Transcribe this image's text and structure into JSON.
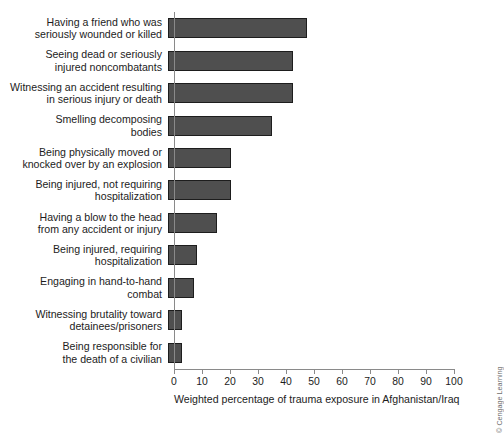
{
  "chart_data": {
    "type": "bar",
    "orientation": "horizontal",
    "title": "",
    "xlabel": "Weighted percentage of trauma exposure in Afghanistan/Iraq",
    "ylabel": "",
    "xlim": [
      0,
      100
    ],
    "xticks": [
      0,
      10,
      20,
      30,
      40,
      50,
      60,
      70,
      80,
      90,
      100
    ],
    "grid": false,
    "legend": null,
    "bar_color": "#4f4f4f",
    "bar_edge_color": "#1d1d1d",
    "categories": [
      "Having a friend who was\nseriously wounded or killed",
      "Seeing dead or seriously\ninjured noncombatants",
      "Witnessing an accident resulting\nin serious injury or death",
      "Smelling decomposing\nbodies",
      "Being physically moved or\nknocked over by an explosion",
      "Being injured, not requiring\nhospitalization",
      "Having a blow to the head\nfrom any accident or injury",
      "Being injured, requiring\nhospitalization",
      "Engaging in hand-to-hand\ncombat",
      "Witnessing brutality toward\ndetainees/prisoners",
      "Being responsible for\nthe death of a civilian"
    ],
    "values": [
      49.5,
      44.5,
      44.5,
      37,
      22.5,
      22.5,
      17.5,
      10.5,
      9.3,
      5,
      5
    ]
  },
  "credit": "© Cengage Learning",
  "ticks": [
    {
      "value": 0,
      "label": "0"
    },
    {
      "value": 10,
      "label": "10"
    },
    {
      "value": 20,
      "label": "20"
    },
    {
      "value": 30,
      "label": "30"
    },
    {
      "value": 40,
      "label": "40"
    },
    {
      "value": 50,
      "label": "50"
    },
    {
      "value": 60,
      "label": "60"
    },
    {
      "value": 70,
      "label": "70"
    },
    {
      "value": 80,
      "label": "80"
    },
    {
      "value": 90,
      "label": "90"
    },
    {
      "value": 100,
      "label": "100"
    }
  ]
}
